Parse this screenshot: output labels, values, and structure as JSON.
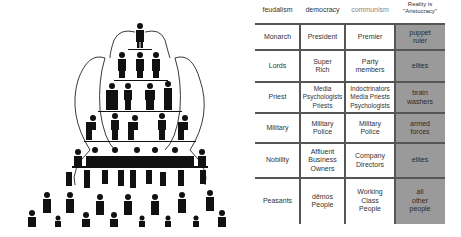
{
  "pyramid": {
    "description": "Social hierarchy pyramid of pictogram figures",
    "levels": [
      "monarch",
      "lords",
      "priests",
      "military",
      "nobility-at-table",
      "peasants-supporting",
      "masses"
    ]
  },
  "table": {
    "headers": [
      "feudalism",
      "democracy",
      "communism",
      "Reality is \"Aristocracy\""
    ],
    "rows": [
      {
        "feudalism": "Monarch",
        "democracy": "President",
        "communism": "Premier",
        "reality": "puppet ruler"
      },
      {
        "feudalism": "Lords",
        "democracy": "Super Rich",
        "communism": "Party members",
        "reality": "elites"
      },
      {
        "feudalism": "Priest",
        "democracy": "Media Psychologists Priests",
        "communism": "Indoctrinators Media Priests Psychologists",
        "reality": "brain washers"
      },
      {
        "feudalism": "Military",
        "democracy": "Military Police",
        "communism": "Military Police",
        "reality": "armed forces"
      },
      {
        "feudalism": "Nobility",
        "democracy": "Affluent Business Owners",
        "communism": "Company Directors",
        "reality": "elites"
      },
      {
        "feudalism": "Peasants",
        "democracy": "dēmos People",
        "communism": "Working Class People",
        "reality": "all other people"
      }
    ],
    "colors": {
      "reality_bg": "#9a9a9a",
      "grid": "#555555"
    }
  }
}
